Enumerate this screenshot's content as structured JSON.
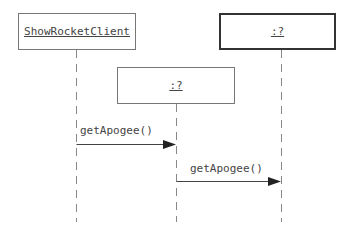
{
  "diagram": {
    "type": "sequence",
    "participants": [
      {
        "id": "client",
        "label": "ShowRocketClient",
        "emphasis": "normal"
      },
      {
        "id": "mid",
        "label": ":?",
        "emphasis": "normal"
      },
      {
        "id": "right",
        "label": ":?",
        "emphasis": "bold"
      }
    ],
    "messages": [
      {
        "from": "client",
        "to": "mid",
        "label": "getApogee()"
      },
      {
        "from": "mid",
        "to": "right",
        "label": "getApogee()"
      }
    ]
  }
}
